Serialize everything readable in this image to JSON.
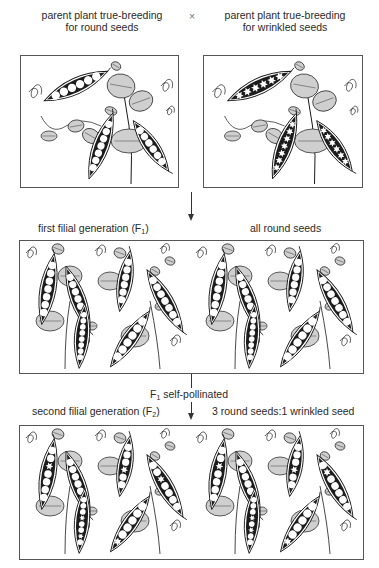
{
  "parents": {
    "left_label_line1": "parent plant true-breeding",
    "left_label_line2": "for round seeds",
    "cross_symbol": "×",
    "right_label_line1": "parent plant true-breeding",
    "right_label_line2": "for wrinkled seeds",
    "left_panel": {
      "seed_type": "round",
      "pods": 3
    },
    "right_panel": {
      "seed_type": "wrinkled",
      "pods": 3
    }
  },
  "f1": {
    "label_prefix": "first filial generation (F",
    "label_sub": "1",
    "label_suffix": ")",
    "result": "all round seeds",
    "panel": {
      "seed_type": "all round",
      "pods": 10
    }
  },
  "self_pollination": {
    "prefix": "F",
    "sub": "1",
    "text": " self-pollinated"
  },
  "f2": {
    "label_prefix": "second filial generation (F",
    "label_sub": "2",
    "label_suffix": ")",
    "result": "3 round seeds:1 wrinkled seed",
    "panel": {
      "seed_type": "mixed 3:1",
      "pods": 10
    }
  },
  "colors": {
    "ink": "#1a1a1a",
    "leaf_fill": "#cfcfcf",
    "pod_dark": "#1c1c1c",
    "seed": "#ffffff",
    "border": "#555555"
  }
}
